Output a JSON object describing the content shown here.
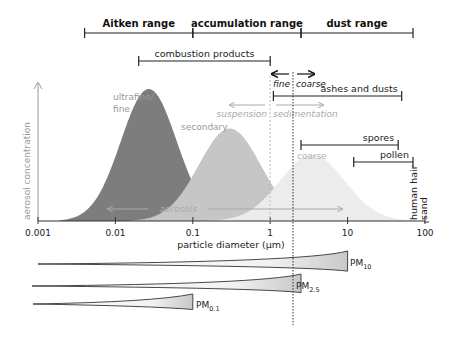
{
  "chart_data": {
    "type": "area",
    "x_scale": "log",
    "xlabel": "particle diameter (µm)",
    "ylabel": "aerosol concentration",
    "xlim": [
      0.001,
      100
    ],
    "x_ticks": [
      "0.001",
      "0.01",
      "0.1",
      "1",
      "10",
      "100"
    ],
    "x_tick_values": [
      0.001,
      0.01,
      0.1,
      1,
      10,
      100
    ],
    "modes": [
      {
        "name": "ultrafine/ fine",
        "label_lines": [
          "ultrafine/",
          "fine"
        ],
        "peak_diameter": 0.027,
        "relative_height": 1.0,
        "color": "#7d7d7d"
      },
      {
        "name": "secondary",
        "label_lines": [
          "secondary"
        ],
        "peak_diameter": 0.3,
        "relative_height": 0.7,
        "color": "#c6c6c6"
      },
      {
        "name": "coarse",
        "label_lines": [
          "coarse"
        ],
        "peak_diameter": 3.5,
        "relative_height": 0.5,
        "color": "#ececec"
      }
    ],
    "ranges": [
      {
        "label": "Aitken range",
        "from": 0.004,
        "to": 0.1
      },
      {
        "label": "accumulation range",
        "from": 0.1,
        "to": 2.5
      },
      {
        "label": "dust range",
        "from": 2.5,
        "to": 70
      }
    ],
    "source_ranges": [
      {
        "label": "combustion products",
        "from": 0.02,
        "to": 1
      },
      {
        "label": "ashes and dusts",
        "from": 1.1,
        "to": 50
      },
      {
        "label": "spores",
        "from": 2.5,
        "to": 45
      },
      {
        "label": "pollen",
        "from": 12,
        "to": 70
      }
    ],
    "vertical_labels": [
      {
        "label": "human hair",
        "at": 70
      },
      {
        "label": "sand",
        "at": 100
      }
    ],
    "annotations": {
      "fine": "fine",
      "coarse": "coarse",
      "suspension": "suspension",
      "sedimentation": "sedimentation",
      "aerosols": "aerosols",
      "fine_coarse_boundary": 2.5,
      "suspension_boundary": 1
    },
    "pm_classes": [
      {
        "main": "PM",
        "sub": "10",
        "cutoff": 10
      },
      {
        "main": "PM",
        "sub": "2.5",
        "cutoff": 2.5
      },
      {
        "main": "PM",
        "sub": "0.1",
        "cutoff": 0.1
      }
    ]
  }
}
